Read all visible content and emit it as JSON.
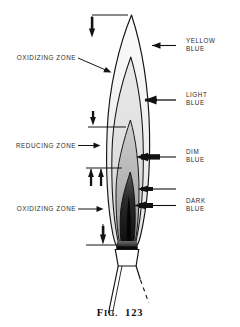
{
  "figure": {
    "caption_prefix": "F",
    "caption_prefix_rest": "IG.",
    "caption_number": "123",
    "caption_full": "FIG. 123"
  },
  "right_labels": [
    {
      "id": "yellow-blue",
      "line1": "YELLOW",
      "line2": "BLUE"
    },
    {
      "id": "light-blue",
      "line1": "LIGHT",
      "line2": "BLUE"
    },
    {
      "id": "dim-blue",
      "line1": "DIM",
      "line2": "BLUE"
    },
    {
      "id": "dark-blue",
      "line1": "DARK",
      "line2": "BLUE"
    }
  ],
  "left_labels": [
    {
      "id": "oxidizing-zone-upper",
      "text": "OXIDIZING ZONE"
    },
    {
      "id": "reducing-zone",
      "text": "REDUCING ZONE"
    },
    {
      "id": "oxidizing-zone-lower",
      "text": "OXIDIZING ZONE"
    }
  ],
  "colors": {
    "ink": "#1a1a1a",
    "label_ink": "#2b2b2b",
    "paper": "#ffffff",
    "zone_yellow_blue": "#f2f2f2",
    "zone_light_blue": "#e0e0e0",
    "zone_dim_blue": "#b9b9b9",
    "zone_dark_blue": "#1c1c1c"
  },
  "diagram": {
    "zone_count": 4
  }
}
